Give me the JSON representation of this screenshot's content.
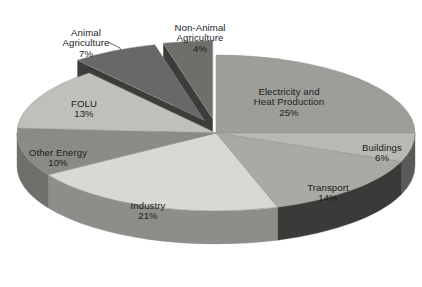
{
  "chart_data": {
    "type": "pie",
    "title": "",
    "subtitle": "",
    "xlabel": "",
    "ylabel": "",
    "legend_position": "none",
    "grid": false,
    "style": "3d-exploded-pie",
    "units": "percent",
    "total": 100,
    "categories": [
      "Electricity and Heat Production",
      "Buildings",
      "Transport",
      "Industry",
      "Other Energy",
      "FOLU",
      "Animal Agriculture",
      "Non-Animal Agriculture"
    ],
    "values": [
      25,
      6,
      14,
      21,
      10,
      13,
      7,
      4
    ],
    "labels": [
      "Electricity and\nHeat Production",
      "Buildings",
      "Transport",
      "Industry",
      "Other Energy",
      "FOLU",
      "Animal\nAgriculture",
      "Non-Animal\nAgriculture"
    ],
    "value_labels": [
      "25%",
      "6%",
      "14%",
      "21%",
      "10%",
      "13%",
      "7%",
      "4%"
    ],
    "colors": [
      "#9d9d99",
      "#b9b9b4",
      "#aaaaa5",
      "#d9d9d4",
      "#8a8a86",
      "#c0c0bb",
      "#686866",
      "#6e6e6b"
    ],
    "side_colors": [
      "#6e6e6b",
      "#5a5a58",
      "#3a3a39",
      "#8d8d89",
      "#6f6f6c",
      "#7b7b78",
      "#3c3c3b",
      "#3c3c3b"
    ],
    "exploded": [
      false,
      false,
      false,
      false,
      false,
      false,
      true,
      true
    ]
  },
  "chart": {
    "slices": [
      {
        "name": "electricity-and-heat-production",
        "label": "Electricity and\nHeat Production",
        "value_label": "25%"
      },
      {
        "name": "buildings",
        "label": "Buildings",
        "value_label": "6%"
      },
      {
        "name": "transport",
        "label": "Transport",
        "value_label": "14%"
      },
      {
        "name": "industry",
        "label": "Industry",
        "value_label": "21%"
      },
      {
        "name": "other-energy",
        "label": "Other Energy",
        "value_label": "10%"
      },
      {
        "name": "folu",
        "label": "FOLU",
        "value_label": "13%"
      },
      {
        "name": "animal-agriculture",
        "label": "Animal\nAgriculture",
        "value_label": "7%"
      },
      {
        "name": "non-animal-agriculture",
        "label": "Non-Animal\nAgriculture",
        "value_label": "4%"
      }
    ]
  }
}
